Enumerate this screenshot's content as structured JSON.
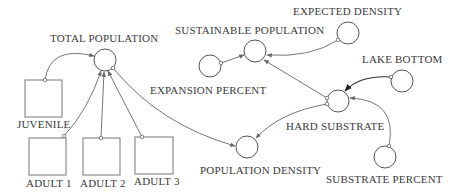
{
  "diagram": {
    "type": "influence-diagram",
    "stocks": [
      {
        "id": "juvenile",
        "label": "JUVENILE"
      },
      {
        "id": "adult1",
        "label": "ADULT 1"
      },
      {
        "id": "adult2",
        "label": "ADULT 2"
      },
      {
        "id": "adult3",
        "label": "ADULT 3"
      }
    ],
    "variables": [
      {
        "id": "total_population",
        "label": "TOTAL POPULATION"
      },
      {
        "id": "sustainable_population",
        "label": "SUSTAINABLE POPULATION"
      },
      {
        "id": "expected_density",
        "label": "EXPECTED DENSITY"
      },
      {
        "id": "expansion_percent",
        "label": "EXPANSION PERCENT"
      },
      {
        "id": "lake_bottom",
        "label": "LAKE BOTTOM"
      },
      {
        "id": "hard_substrate",
        "label": "HARD SUBSTRATE"
      },
      {
        "id": "population_density",
        "label": "POPULATION DENSITY"
      },
      {
        "id": "substrate_percent",
        "label": "SUBSTRATE PERCENT"
      }
    ],
    "links": [
      {
        "from": "juvenile",
        "to": "total_population"
      },
      {
        "from": "adult1",
        "to": "total_population"
      },
      {
        "from": "adult2",
        "to": "total_population"
      },
      {
        "from": "adult3",
        "to": "total_population"
      },
      {
        "from": "total_population",
        "to": "population_density"
      },
      {
        "from": "expansion_percent",
        "to": "sustainable_population"
      },
      {
        "from": "expected_density",
        "to": "sustainable_population"
      },
      {
        "from": "hard_substrate",
        "to": "sustainable_population"
      },
      {
        "from": "lake_bottom",
        "to": "hard_substrate"
      },
      {
        "from": "substrate_percent",
        "to": "hard_substrate"
      },
      {
        "from": "hard_substrate",
        "to": "population_density"
      }
    ]
  }
}
